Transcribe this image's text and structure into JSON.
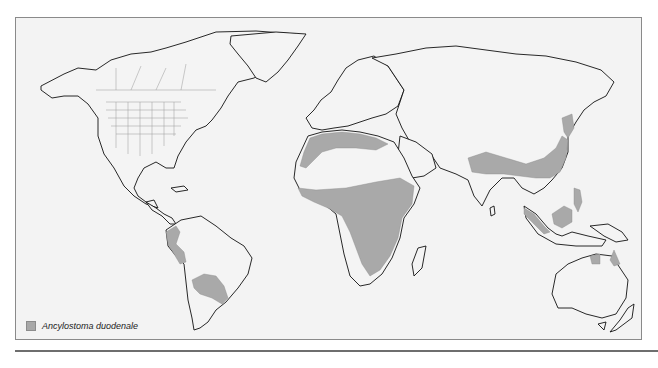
{
  "figure": {
    "type": "world-distribution-map",
    "legend": {
      "items": [
        {
          "label": "Ancylostoma duodenale",
          "color": "#a9a9a9"
        }
      ]
    },
    "colors": {
      "background": "#f3f3f3",
      "land": "#f4f4f4",
      "endemic_area": "#a9a9a9",
      "coastline": "#111111",
      "borders": "#999999",
      "frame": "#8a8a8a"
    },
    "endemic_regions": [
      "Northwest Africa (Maghreb coast)",
      "Nile valley / Egypt",
      "Sub-Saharan Africa (Sahel to Zambia/Mozambique)",
      "Arabian Peninsula west coast",
      "Northern India / Himalayan belt",
      "Southern and eastern China",
      "Korea / Northeast China coast",
      "Southeast Asia: Malaysia, Sumatra, Borneo, Philippines, Sulawesi",
      "Northern Australia (Northern Territory, Cape York)",
      "Western South America (Peru/Ecuador)",
      "Paraguay / southern Brazil / northern Argentina"
    ]
  }
}
